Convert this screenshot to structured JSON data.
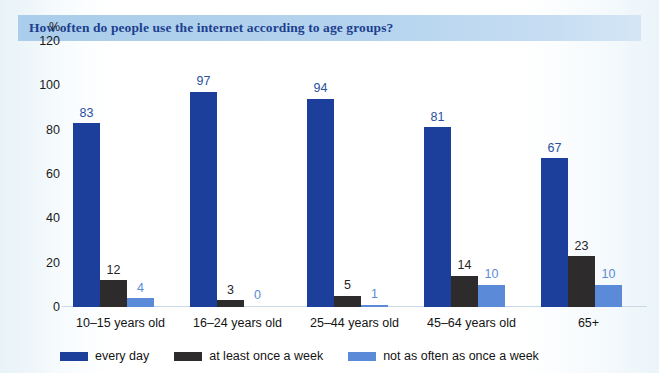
{
  "header": {
    "title": "How often do people use the internet according to age groups?",
    "band_color": "#b4d3ee",
    "title_color": "#1d3f8f"
  },
  "chart_data": {
    "type": "bar",
    "title": "How often do people use the internet according to age groups?",
    "xlabel": "",
    "ylabel": "%",
    "unit_label": "%",
    "ylim": [
      0,
      120
    ],
    "yticks": [
      0,
      20,
      40,
      60,
      80,
      100,
      120
    ],
    "grid": false,
    "legend_position": "bottom",
    "categories": [
      "10–15 years old",
      "16–24 years old",
      "25–44 years old",
      "45–64 years old",
      "65+"
    ],
    "series": [
      {
        "name": "every day",
        "color": "#1c3f9c",
        "values": [
          83,
          97,
          94,
          81,
          67
        ]
      },
      {
        "name": "at least once a week",
        "color": "#2d2b2b",
        "values": [
          12,
          3,
          5,
          14,
          23
        ]
      },
      {
        "name": "not as often as once a week",
        "color": "#5b8ad9",
        "values": [
          4,
          0,
          1,
          10,
          10
        ]
      }
    ]
  }
}
